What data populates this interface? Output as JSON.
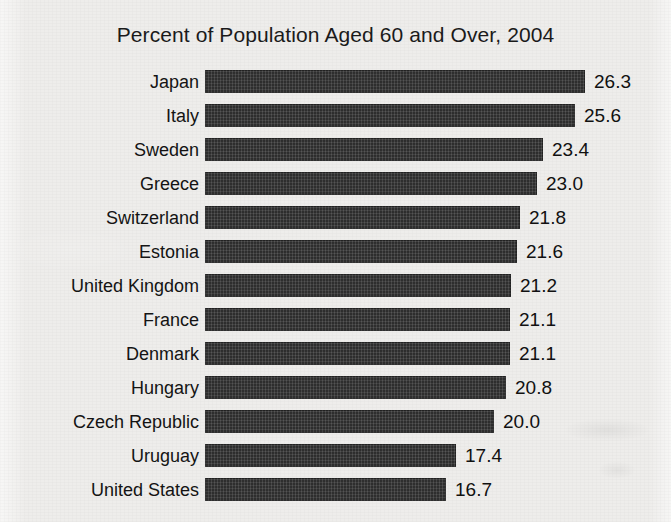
{
  "chart_data": {
    "type": "bar",
    "orientation": "horizontal",
    "title": "Percent of Population Aged 60 and Over, 2004",
    "xlabel": "",
    "ylabel": "",
    "xlim": [
      0,
      26.3
    ],
    "grid": false,
    "legend": null,
    "value_labels": true,
    "categories": [
      "Japan",
      "Italy",
      "Sweden",
      "Greece",
      "Switzerland",
      "Estonia",
      "United Kingdom",
      "France",
      "Denmark",
      "Hungary",
      "Czech Republic",
      "Uruguay",
      "United States"
    ],
    "values": [
      26.3,
      25.6,
      23.4,
      23.0,
      21.8,
      21.6,
      21.2,
      21.1,
      21.1,
      20.8,
      20.0,
      17.4,
      16.7
    ],
    "value_label_text": [
      "26.3",
      "25.6",
      "23.4",
      "23.0",
      "21.8",
      "21.6",
      "21.2",
      "21.1",
      "21.1",
      "20.8",
      "20.0",
      "17.4",
      "16.7"
    ],
    "colors": {
      "bar": "#2e2e2e",
      "background": "#eeedeb",
      "text": "#141414"
    }
  }
}
